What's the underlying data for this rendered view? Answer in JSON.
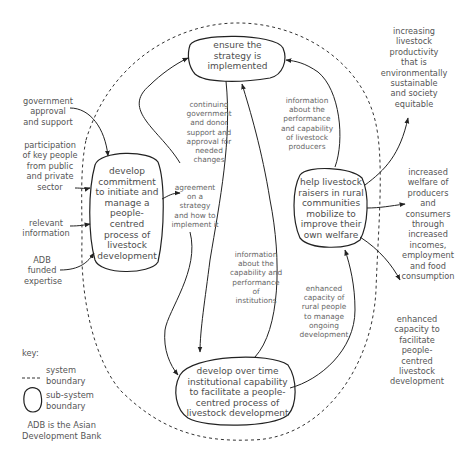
{
  "nodes": {
    "develop_commitment": "develop\ncommitment\nto initiate and\nmanage a\npeople-centred\nprocess of\nlivestock\ndevelopment",
    "ensure_strategy": "ensure the\nstrategy is\nimplemented",
    "help_livestock": "help livestock\nraisers in rural\ncommunities\nmobilize to\nimprove their\nown welfare",
    "develop_institutional": "develop over time\ninstitutional capability\nto facilitate a people-\ncentred process of\nlivestock development"
  },
  "inputs": {
    "government_approval": "government\napproval\nand support",
    "participation": "participation\nof key people\nfrom public\nand private\nsector",
    "relevant_information": "relevant\ninformation",
    "adb_expertise": "ADB\nfunded\nexpertise"
  },
  "flows": {
    "agreement": "agreement\non a\nstrategy\nand how to\nimplement it",
    "continuing_support": "continuing\ngovernment\nand donor\nsupport and\napproval for\nneeded\nchanges",
    "info_producers": "information\nabout the\nperformance\nand capability\nof livestock\nproducers",
    "info_institutions": "information\nabout the\ncapability and\nperformance\nof\ninstitutions",
    "enhanced_rural": "enhanced\ncapacity of\nrural people\nto manage\nongoing\ndevelopment"
  },
  "outputs": {
    "productivity": "increasing\nlivestock\nproductivity\nthat is\nenvironmentally\nsustainable\nand society\nequitable",
    "welfare": "increased\nwelfare of\nproducers\nand\nconsumers\nthrough\nincreased\nincomes,\nemployment\nand food\nconsumption",
    "capacity": "enhanced\ncapacity to\nfacilitate\npeople-\ncentred\nlivestock\ndevelopment"
  },
  "key": {
    "title": "key:",
    "system_boundary": "system\nboundary",
    "subsystem_boundary": "sub-system\nboundary",
    "note": "ADB is the Asian\nDevelopment Bank"
  },
  "colors": {
    "line": "#333333",
    "text": "#555555"
  }
}
